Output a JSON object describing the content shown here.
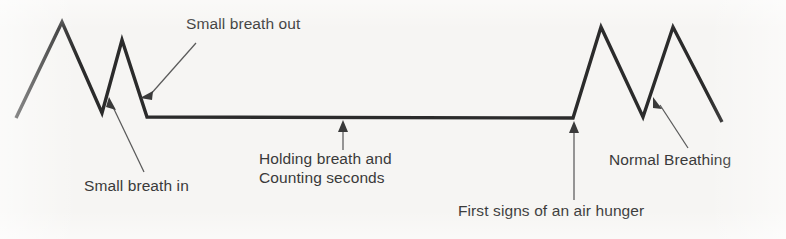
{
  "figure": {
    "background_color": "#f6f5f3",
    "trace_color": "#2b2b2b",
    "label_color": "#3a3a3a",
    "leader_color": "#5a5a5a"
  },
  "labels": {
    "small_breath_out": "Small breath out",
    "small_breath_in": "Small breath in",
    "holding_breath_line1": "Holding breath and",
    "holding_breath_line2": "Counting seconds",
    "first_signs": "First signs of an air hunger",
    "normal_breathing": "Normal Breathing"
  },
  "chart_data": {
    "type": "line",
    "title": "",
    "xlabel": "",
    "ylabel": "",
    "grid": false,
    "legend": "none",
    "series": [
      {
        "name": "breathing trace",
        "points": [
          [
            16,
            118
          ],
          [
            62,
            22
          ],
          [
            102,
            113
          ],
          [
            122,
            40
          ],
          [
            147,
            117
          ],
          [
            573,
            118
          ],
          [
            601,
            27
          ],
          [
            643,
            117
          ],
          [
            673,
            27
          ],
          [
            722,
            122
          ]
        ]
      }
    ],
    "annotations": [
      {
        "text": "Small breath out",
        "target": [
          140,
          96
        ],
        "anchor": [
          192,
          42
        ],
        "arrow": true
      },
      {
        "text": "Small breath in",
        "target": [
          110,
          103
        ],
        "anchor": [
          145,
          172
        ],
        "arrow": true
      },
      {
        "text": "Holding breath and Counting seconds",
        "target": [
          343,
          122
        ],
        "anchor": [
          343,
          149
        ],
        "arrow": true
      },
      {
        "text": "First signs of an air hunger",
        "target": [
          574,
          123
        ],
        "anchor": [
          574,
          200
        ],
        "arrow": true
      },
      {
        "text": "Normal Breathing",
        "target": [
          654,
          101
        ],
        "anchor": [
          686,
          148
        ],
        "arrow": true
      }
    ]
  }
}
